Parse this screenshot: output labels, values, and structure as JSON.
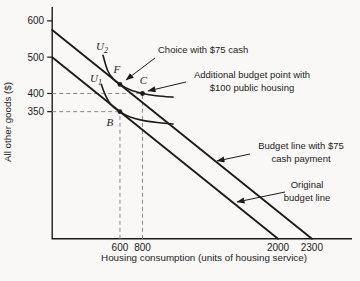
{
  "chart_data": {
    "type": "line",
    "title": "",
    "xlabel": "Housing consumption (units of housing service)",
    "ylabel": "All other goods ($)",
    "xlim": [
      0,
      2655
    ],
    "ylim": [
      0,
      640
    ],
    "grid": false,
    "x_ticks": [
      600,
      800,
      2000,
      2300
    ],
    "y_ticks": [
      350,
      400,
      500,
      600
    ],
    "series": [
      {
        "name": "budget-line-75-cash",
        "label": "Budget line with $75 cash payment",
        "width": 1.9,
        "smooth": false,
        "points": [
          [
            0,
            575
          ],
          [
            2300,
            0
          ]
        ]
      },
      {
        "name": "original-budget-line",
        "label": "Original budget line",
        "width": 1.9,
        "smooth": false,
        "points": [
          [
            0,
            500
          ],
          [
            2000,
            0
          ]
        ]
      },
      {
        "name": "indifference-curve-u2",
        "label": "U2",
        "width": 1.6,
        "smooth": true,
        "points": [
          [
            450,
            505
          ],
          [
            490,
            464
          ],
          [
            540,
            440
          ],
          [
            600,
            425
          ],
          [
            690,
            410
          ],
          [
            800,
            400
          ],
          [
            920,
            394
          ],
          [
            1070,
            390
          ]
        ]
      },
      {
        "name": "indifference-curve-u1",
        "label": "U1",
        "width": 1.6,
        "smooth": true,
        "points": [
          [
            435,
            425
          ],
          [
            470,
            396
          ],
          [
            520,
            369
          ],
          [
            600,
            350
          ],
          [
            690,
            335
          ],
          [
            800,
            326
          ],
          [
            930,
            320
          ],
          [
            1070,
            316
          ]
        ]
      }
    ],
    "points": [
      {
        "label": "F",
        "x": 600,
        "y": 425,
        "label_dx": -3,
        "label_dy": -11
      },
      {
        "label": "C",
        "x": 800,
        "y": 400,
        "label_dx": 1,
        "label_dy": -9
      },
      {
        "label": "B",
        "x": 600,
        "y": 350,
        "label_dx": -10,
        "label_dy": 14
      }
    ],
    "curve_labels": [
      {
        "text": "U",
        "sub": "2",
        "px": 102,
        "py": 50
      },
      {
        "text": "U",
        "sub": "1",
        "px": 96,
        "py": 82
      }
    ],
    "guides": [
      {
        "name": "dash-400-horizontal",
        "from": [
          0,
          400
        ],
        "to": [
          800,
          400
        ]
      },
      {
        "name": "dash-350-horizontal",
        "from": [
          0,
          350
        ],
        "to": [
          600,
          350
        ]
      },
      {
        "name": "dash-600-vertical",
        "from": [
          600,
          0
        ],
        "to": [
          600,
          350
        ]
      },
      {
        "name": "dash-800-vertical",
        "from": [
          800,
          0
        ],
        "to": [
          800,
          400
        ]
      }
    ],
    "annotations": [
      {
        "name": "choice-75-cash-callout",
        "lines": [
          "Choice with $75 cash"
        ],
        "x": 158,
        "y": 53,
        "anchor": "start",
        "arrow": [
          155,
          58,
          126,
          80
        ]
      },
      {
        "name": "additional-budget-point-callout",
        "lines": [
          "Additional budget point with",
          "$100 public housing"
        ],
        "x": 252,
        "y": 78,
        "anchor": "middle",
        "arrow": [
          186,
          82,
          148,
          91
        ]
      },
      {
        "name": "budget-line-75-callout",
        "lines": [
          "Budget line with $75",
          "cash payment"
        ],
        "x": 301,
        "y": 149,
        "anchor": "middle",
        "arrow": [
          250,
          154,
          217,
          161
        ]
      },
      {
        "name": "original-budget-line-callout",
        "lines": [
          "Original",
          "budget line"
        ],
        "x": 307,
        "y": 188,
        "anchor": "middle",
        "arrow": [
          285,
          192,
          237,
          202
        ]
      }
    ],
    "pixel_mapping": {
      "x0": 52.2,
      "xs": 0.1129,
      "y0": 238.8,
      "ys": 0.3633
    },
    "axis_px": {
      "x_end": 352,
      "y_top": 7,
      "tick_len": 5
    },
    "colors": {
      "line": "#1c1c1c",
      "dash": "#8a8a8a",
      "text": "#1c1c1c"
    }
  }
}
